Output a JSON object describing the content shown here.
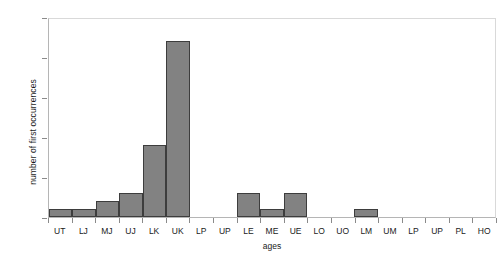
{
  "chart_data": {
    "type": "bar",
    "title": "",
    "subtitle": "",
    "xlabel": "ages",
    "ylabel": "number of first occurrences",
    "categories": [
      "UT",
      "LJ",
      "MJ",
      "UJ",
      "LK",
      "UK",
      "LP",
      "UP",
      "LE",
      "ME",
      "UE",
      "LO",
      "UO",
      "LM",
      "UM",
      "LP",
      "UP",
      "PL",
      "HO"
    ],
    "values": [
      1,
      1,
      2,
      3,
      9,
      22,
      0,
      0,
      3,
      1,
      3,
      0,
      0,
      1,
      0,
      0,
      0,
      0,
      0
    ],
    "ylim": [
      0,
      25
    ],
    "yticks": [
      0,
      5,
      10,
      15,
      20,
      25
    ],
    "ytick_labels": [
      "0",
      "5",
      "10",
      "15",
      "20",
      "25"
    ],
    "grid": false,
    "legend": false,
    "legend_position": "none",
    "bar_fill_color": "#828282",
    "bar_edge_color": "#3d3d3d",
    "plot_background_color": "#ffffff",
    "axis_color": "#b5b5b5",
    "frame_color": "#d9d9d9",
    "text_color": "#1a1a1a",
    "bar_gap": 0
  }
}
